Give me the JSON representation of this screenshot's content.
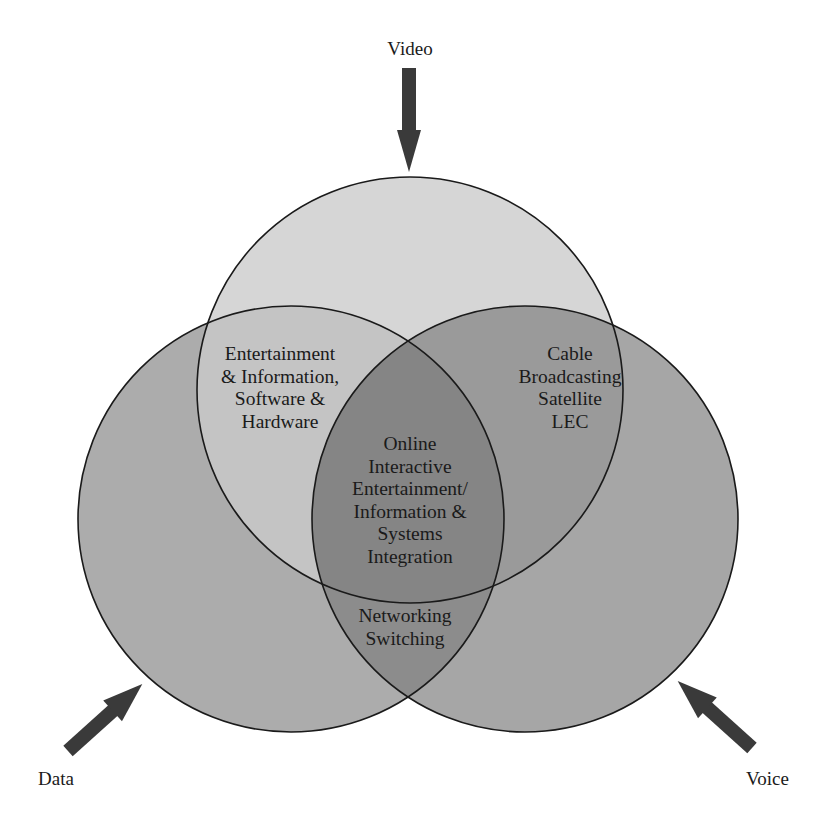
{
  "diagram": {
    "type": "venn",
    "sets": [
      {
        "id": "video",
        "label": "Video",
        "color": "#d6d6d6"
      },
      {
        "id": "data",
        "label": "Data",
        "color": "#acacac"
      },
      {
        "id": "voice",
        "label": "Voice",
        "color": "#a6a6a6"
      }
    ],
    "regions": {
      "video_data": {
        "color": "#c4c4c4",
        "lines": [
          "Entertainment",
          "& Information,",
          "Software &",
          "Hardware"
        ]
      },
      "video_voice": {
        "color": "#9a9a9a",
        "lines": [
          "Cable",
          "Broadcasting",
          "Satellite",
          "LEC"
        ]
      },
      "data_voice": {
        "color": "#8c8c8c",
        "lines": [
          "Networking",
          "Switching"
        ]
      },
      "all": {
        "color": "#858585",
        "lines": [
          "Online",
          "Interactive",
          "Entertainment/",
          "Information &",
          "Systems",
          "Integration"
        ]
      }
    },
    "arrow_color": "#3a3a3a",
    "outline_color": "#1a1a1a"
  }
}
